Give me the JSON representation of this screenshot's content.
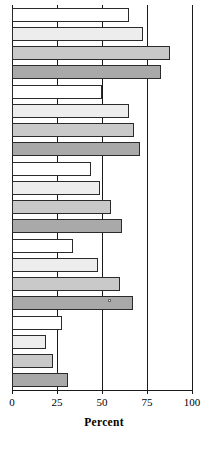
{
  "chart_data": {
    "type": "bar",
    "orientation": "horizontal",
    "title": "",
    "xlabel": "Percent",
    "ylabel": "",
    "xlim": [
      0,
      100
    ],
    "xticks": [
      0,
      25,
      50,
      75,
      100
    ],
    "xtick_labels": [
      "0",
      "25",
      "50",
      "75",
      "100"
    ],
    "grid": true,
    "grid_axis": "x",
    "legend": "none",
    "categories": [
      "Group 1",
      "Group 2",
      "Group 3",
      "Group 4",
      "Group 5"
    ],
    "series": [
      {
        "name": "Series 1",
        "color": "#ffffff",
        "values": [
          65,
          50,
          44,
          34,
          28
        ]
      },
      {
        "name": "Series 2",
        "color": "#ededed",
        "values": [
          73,
          65,
          49,
          48,
          19
        ]
      },
      {
        "name": "Series 3",
        "color": "#c9c9c9",
        "values": [
          88,
          68,
          55,
          60,
          23
        ]
      },
      {
        "name": "Series 4",
        "color": "#a9a9a9",
        "values": [
          83,
          71,
          61,
          67,
          31
        ]
      }
    ],
    "bars": [
      {
        "group": 0,
        "series": 0,
        "value": 65
      },
      {
        "group": 0,
        "series": 1,
        "value": 73
      },
      {
        "group": 0,
        "series": 2,
        "value": 88
      },
      {
        "group": 0,
        "series": 3,
        "value": 83
      },
      {
        "group": 1,
        "series": 0,
        "value": 50
      },
      {
        "group": 1,
        "series": 1,
        "value": 65
      },
      {
        "group": 1,
        "series": 2,
        "value": 68
      },
      {
        "group": 1,
        "series": 3,
        "value": 71
      },
      {
        "group": 2,
        "series": 0,
        "value": 44
      },
      {
        "group": 2,
        "series": 1,
        "value": 49
      },
      {
        "group": 2,
        "series": 2,
        "value": 55
      },
      {
        "group": 2,
        "series": 3,
        "value": 61
      },
      {
        "group": 3,
        "series": 0,
        "value": 34
      },
      {
        "group": 3,
        "series": 1,
        "value": 48
      },
      {
        "group": 3,
        "series": 2,
        "value": 60
      },
      {
        "group": 3,
        "series": 3,
        "value": 67
      },
      {
        "group": 4,
        "series": 0,
        "value": 28
      },
      {
        "group": 4,
        "series": 1,
        "value": 19
      },
      {
        "group": 4,
        "series": 2,
        "value": 23
      },
      {
        "group": 4,
        "series": 3,
        "value": 31
      }
    ]
  },
  "axis": {
    "title": "Percent",
    "ticks": [
      {
        "value": 0,
        "label": "0"
      },
      {
        "value": 25,
        "label": "25"
      },
      {
        "value": 50,
        "label": "50"
      },
      {
        "value": 75,
        "label": "75"
      },
      {
        "value": 100,
        "label": "100"
      }
    ]
  },
  "colors": {
    "series_1": "#ffffff",
    "series_2": "#ededed",
    "series_3": "#c9c9c9",
    "series_4": "#a9a9a9",
    "outline": "#2b2b2b",
    "grid": "#1a1a1a",
    "background": "#ffffff"
  }
}
